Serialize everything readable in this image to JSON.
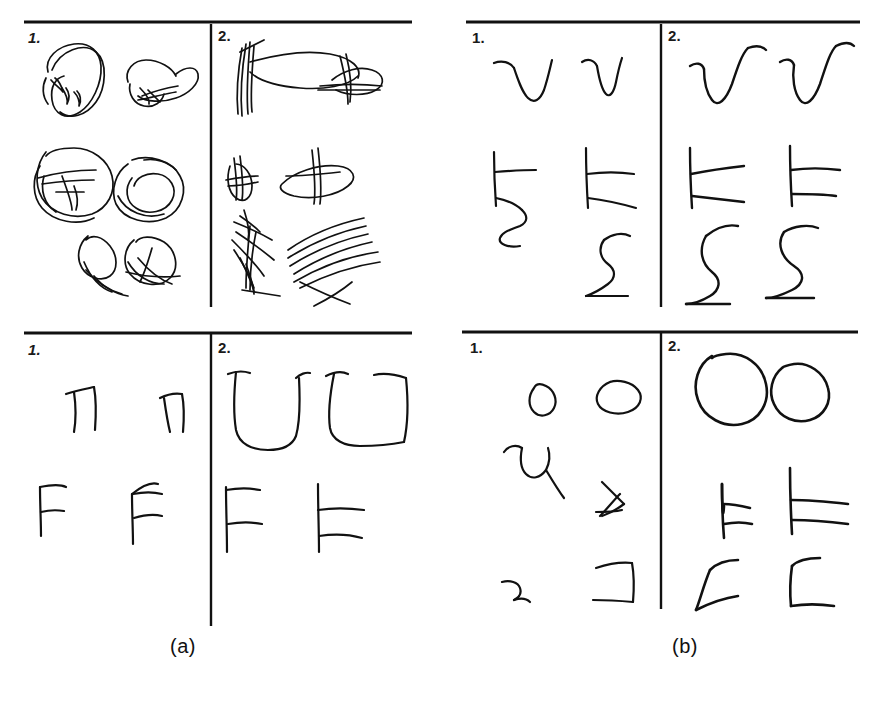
{
  "figure": {
    "kind": "scanned-handwriting-figure",
    "background_color": "#ffffff",
    "ink_color": "#111111",
    "width": 873,
    "height": 712,
    "captions": [
      {
        "id": "caption-a",
        "text": "(a)",
        "x": 170,
        "y": 636
      },
      {
        "id": "caption-b",
        "text": "(b)",
        "x": 672,
        "y": 636
      }
    ],
    "groups": [
      {
        "id": "group-a",
        "caption": "(a)",
        "panels": [
          {
            "id": "panel-a-top-left",
            "label": "1.",
            "label_style": "slant",
            "content": "overlapping scribbled loops and ellipses"
          },
          {
            "id": "panel-a-top-right",
            "label": "2.",
            "label_style": "plain",
            "content": "dense crossing scratch strokes and elongated loops"
          },
          {
            "id": "panel-a-bottom-left",
            "label": "1.",
            "label_style": "slant",
            "content": "pi-like and F-like glyph strokes"
          },
          {
            "id": "panel-a-bottom-right",
            "label": "2.",
            "label_style": "plain",
            "content": "large U-shaped and F-shaped glyph strokes"
          }
        ]
      },
      {
        "id": "group-b",
        "caption": "(b)",
        "panels": [
          {
            "id": "panel-b-top-left",
            "label": "1.",
            "label_style": "plain",
            "content": "V-shaped, E-like and S-like glyph strokes"
          },
          {
            "id": "panel-b-top-right",
            "label": "2.",
            "label_style": "plain",
            "content": "V-shaped, E-like and sigma-like glyph strokes"
          },
          {
            "id": "panel-b-bottom-left",
            "label": "1.",
            "label_style": "plain",
            "content": "small loops, U, triangle and bracket strokes"
          },
          {
            "id": "panel-b-bottom-right",
            "label": "2.",
            "label_style": "plain",
            "content": "closed ovals, E-like and C-like glyph strokes"
          }
        ]
      }
    ],
    "rules": {
      "horizontal": [
        {
          "id": "rule-a-top",
          "x1": 24,
          "y1": 22,
          "x2": 412,
          "y2": 22
        },
        {
          "id": "rule-b-top",
          "x1": 466,
          "y1": 22,
          "x2": 860,
          "y2": 22
        },
        {
          "id": "rule-a-bottom",
          "x1": 24,
          "y1": 333,
          "x2": 412,
          "y2": 333
        },
        {
          "id": "rule-b-bottom",
          "x1": 462,
          "y1": 332,
          "x2": 858,
          "y2": 332
        }
      ],
      "vertical": [
        {
          "id": "divider-a-top",
          "x1": 211,
          "y1": 24,
          "x2": 211,
          "y2": 307
        },
        {
          "id": "divider-b-top",
          "x1": 661,
          "y1": 24,
          "x2": 661,
          "y2": 307
        },
        {
          "id": "divider-a-bottom",
          "x1": 211,
          "y1": 334,
          "x2": 211,
          "y2": 626
        },
        {
          "id": "divider-b-bottom",
          "x1": 661,
          "y1": 333,
          "x2": 661,
          "y2": 609
        }
      ]
    }
  }
}
